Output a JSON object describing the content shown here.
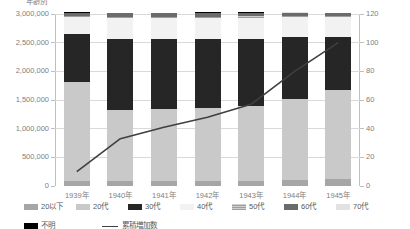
{
  "chart_data": {
    "type": "bar",
    "title": "年齢別",
    "categories": [
      "1939年",
      "1940年",
      "1941年",
      "1942年",
      "1943年",
      "1944年",
      "1945年"
    ],
    "xlabel": "",
    "ylabel": "",
    "ylim": [
      0,
      3000000
    ],
    "yticks": [
      "0",
      "500,000",
      "1,000,000",
      "1,500,000",
      "2,000,000",
      "2,500,000",
      "3,000,000"
    ],
    "y2lim": [
      0,
      120
    ],
    "y2ticks": [
      "0",
      "20",
      "40",
      "60",
      "80",
      "100",
      "120"
    ],
    "grid": true,
    "legend_position": "bottom",
    "stacked": true,
    "series": [
      {
        "name": "20以下",
        "key": "20under",
        "color": "#a6a6a6",
        "values": [
          95000,
          90000,
          88000,
          86000,
          92000,
          105000,
          120000
        ]
      },
      {
        "name": "20代",
        "key": "20s",
        "color": "#c9c9c9",
        "values": [
          1720000,
          1240000,
          1260000,
          1270000,
          1300000,
          1420000,
          1560000
        ]
      },
      {
        "name": "30代",
        "key": "30s",
        "color": "#262626",
        "values": [
          830000,
          1230000,
          1210000,
          1200000,
          1170000,
          1080000,
          920000
        ]
      },
      {
        "name": "40代",
        "key": "40s",
        "color": "#f2f2f2",
        "values": [
          300000,
          370000,
          375000,
          380000,
          375000,
          345000,
          340000
        ]
      },
      {
        "name": "50代",
        "key": "50s",
        "color": "#bdbdbd",
        "values": [
          18000,
          20000,
          20000,
          20000,
          20000,
          20000,
          20000
        ]
      },
      {
        "name": "60代",
        "key": "60s",
        "color": "#6b6b6b",
        "values": [
          55000,
          62000,
          62000,
          62000,
          60000,
          56000,
          52000
        ]
      },
      {
        "name": "70代",
        "key": "70s",
        "color": "#e2e2e2",
        "values": [
          6000,
          6000,
          6000,
          6000,
          6000,
          6000,
          6000
        ]
      },
      {
        "name": "不明",
        "key": "unknown",
        "color": "#000000",
        "values": [
          6000,
          6000,
          6000,
          6000,
          6000,
          6000,
          6000
        ]
      }
    ],
    "line_series": {
      "name": "累積増加数",
      "color": "#3f3f3f",
      "axis": "right",
      "values": [
        10,
        33,
        41,
        48,
        57,
        80,
        100
      ]
    }
  },
  "legend": {
    "rows": [
      [
        {
          "label": "20以下",
          "key": "20under"
        },
        {
          "label": "20代",
          "key": "20s"
        },
        {
          "label": "30代",
          "key": "30s"
        },
        {
          "label": "40代",
          "key": "40s"
        },
        {
          "label": "50代",
          "key": "50s"
        },
        {
          "label": "60代",
          "key": "60s"
        },
        {
          "label": "70代",
          "key": "70s"
        }
      ],
      [
        {
          "label": "不明",
          "key": "unknown"
        },
        {
          "label": "累積増加数",
          "key": "line"
        }
      ]
    ]
  }
}
